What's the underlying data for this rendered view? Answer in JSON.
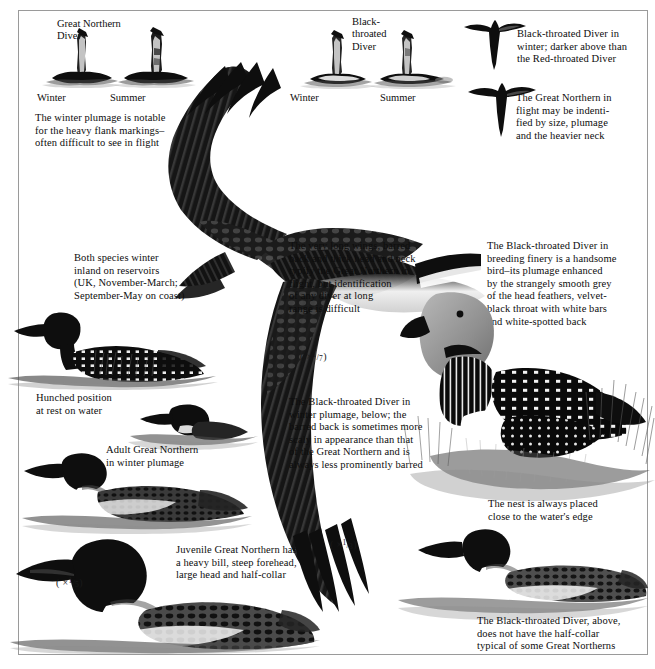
{
  "plate": {
    "title": "Divers identification plate",
    "subject_species": [
      "Great Northern Diver",
      "Black-throated Diver"
    ],
    "ink_color": "#0e0e0e",
    "paper_color": "#ffffff"
  },
  "swim_silhouettes": {
    "great_northern": {
      "species_label": "Great Northern\nDiver",
      "winter_label": "Winter",
      "summer_label": "Summer"
    },
    "black_throated": {
      "species_label": "Black-\nthroated\nDiver",
      "winter_label": "Winter",
      "summer_label": "Summer"
    }
  },
  "captions": {
    "winter_plumage_flank": "The winter plumage is notable\nfor the heavy flank markings–\noften difficult to see in flight",
    "bt_in_winter_flight": "Black-throated Diver in\nwinter; darker above than\nthe Red-throated Diver",
    "gn_in_flight": "The Great Northern in\nflight may be indenti-\nfied by size, plumage\nand the heavier neck",
    "both_species_winter": "Both species winter\ninland on reservoirs\n(UK, November-March;\nSeptember-May on coast)",
    "long_wings": "The very long wings, barred\nback and thick head and neck\ntypify the Great Northern in\nflight, but identification\nof any diver at long\nrange is difficult",
    "bt_breeding_finery": "The Black-throated Diver in\nbreeding finery is a handsome\nbird–its plumage enhanced\nby the strangely smooth grey\nof the head feathers, velvet-\nblack throat with white bars\nand white-spotted back",
    "hunched_position": "Hunched position\nat rest on water",
    "adult_gn_winter": "Adult Great Northern\nin winter plumage",
    "bt_winter_plumage": "The Black-throated Diver in\nwinter plumage, below; the\nbarred back is sometimes more\nscaly in appearance than that\nof the Great Northern and is\nalways less prominently barred",
    "nest_placement": "The nest is always placed\nclose to the water's edge",
    "juvenile_gn": "Juvenile Great Northern has\na heavy bill, steep forehead,\nlarge head and half-collar",
    "bt_no_half_collar": "The Black-throated Diver, above,\ndoes not have the half-collar\ntypical of some Great Northerns"
  },
  "scales": {
    "flight_bird": {
      "prefix": "( ×",
      "numerator": "1",
      "denominator": "7",
      "suffix": ")"
    },
    "bt_winter_swim": {
      "prefix": "( ×",
      "numerator": "1",
      "denominator": "3",
      "suffix": ")"
    },
    "juvenile_gn": {
      "prefix": "( ×",
      "numerator": "1",
      "denominator": "5",
      "suffix": ")"
    }
  },
  "figures": {
    "gn_winter_silhouette": "great-northern-winter-swimming-silhouette",
    "gn_summer_silhouette": "great-northern-summer-swimming-silhouette",
    "bt_winter_silhouette": "black-throated-winter-swimming-silhouette",
    "bt_summer_silhouette": "black-throated-summer-swimming-silhouette",
    "bt_flight_silhouette": "black-throated-diver-in-flight-silhouette",
    "gn_flight_silhouette": "great-northern-diver-in-flight-silhouette",
    "main_flight_bird": "great-northern-diver-in-flight-large",
    "gn_summer_swimming": "great-northern-diver-summer-plumage-swimming",
    "gn_hunched": "great-northern-diver-hunched-at-rest",
    "gn_winter_swimming": "adult-great-northern-diver-winter-plumage-swimming",
    "gn_juvenile": "juvenile-great-northern-diver-swimming",
    "bt_breeding_nest": "black-throated-diver-breeding-plumage-at-nest",
    "bt_winter_swimming": "black-throated-diver-winter-plumage-swimming"
  }
}
